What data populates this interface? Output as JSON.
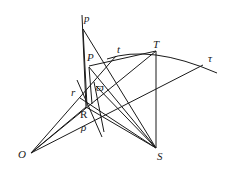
{
  "figure": {
    "title": "",
    "labels": {
      "p": "p",
      "P": "P",
      "t": "t",
      "T": "T",
      "tau": "τ",
      "omega": "ϖ",
      "r": "r",
      "R": "R",
      "rho": "ρ",
      "O": "O",
      "S": "S"
    },
    "points": {
      "p": [
        83,
        29
      ],
      "P": [
        89,
        67
      ],
      "T": [
        156,
        51
      ],
      "t_pt": [
        113,
        58
      ],
      "tau_pt": [
        203,
        65
      ],
      "omega": [
        97,
        86
      ],
      "r": [
        80,
        98
      ],
      "R": [
        86,
        107
      ],
      "rho": [
        92,
        113
      ],
      "O": [
        31,
        153
      ],
      "S": [
        156,
        148
      ]
    },
    "colors": {
      "ink": "#1a1a1a",
      "background": "#ffffff"
    }
  }
}
